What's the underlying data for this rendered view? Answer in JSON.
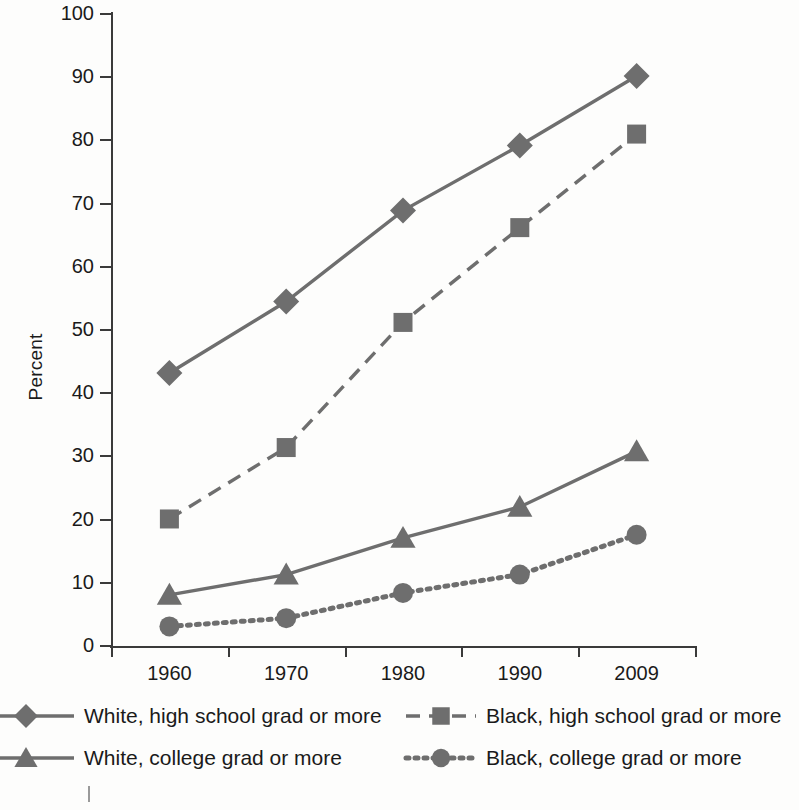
{
  "chart_data": {
    "type": "line",
    "title": "",
    "xlabel": "",
    "ylabel": "Percent",
    "categories": [
      "1960",
      "1970",
      "1980",
      "1990",
      "2009"
    ],
    "ylim": [
      0,
      100
    ],
    "yticks": [
      0,
      10,
      20,
      30,
      40,
      50,
      60,
      70,
      80,
      90,
      100
    ],
    "ytick_labels": [
      "0",
      "10",
      "20",
      "30",
      "40",
      "50",
      "60",
      "70",
      "80",
      "90",
      "100"
    ],
    "grid": false,
    "legend_position": "bottom",
    "series": [
      {
        "name": "White, high school grad or more",
        "marker": "diamond",
        "linestyle": "solid",
        "color": "#6e6e6e",
        "values": [
          43.2,
          54.5,
          68.9,
          79.2,
          90.2
        ]
      },
      {
        "name": "Black, high school grad or more",
        "marker": "square",
        "linestyle": "dashed",
        "color": "#6e6e6e",
        "values": [
          20.1,
          31.4,
          51.2,
          66.2,
          81.0
        ]
      },
      {
        "name": "White, college grad or more",
        "marker": "triangle",
        "linestyle": "solid",
        "color": "#6e6e6e",
        "values": [
          8.1,
          11.3,
          17.1,
          22.0,
          30.8
        ]
      },
      {
        "name": "Black, college grad or more",
        "marker": "circle",
        "linestyle": "dotted",
        "color": "#6e6e6e",
        "values": [
          3.1,
          4.4,
          8.4,
          11.3,
          17.6
        ]
      }
    ]
  },
  "axis": {
    "y_title": "Percent",
    "y_tick_labels": [
      "100",
      "90",
      "80",
      "70",
      "60",
      "50",
      "40",
      "30",
      "20",
      "10",
      "0"
    ],
    "x_tick_labels": [
      "1960",
      "1970",
      "1980",
      "1990",
      "2009"
    ]
  },
  "legend": {
    "entries": [
      {
        "label": "White, high school grad or more",
        "marker": "diamond-marker-icon",
        "linestyle": "solid"
      },
      {
        "label": "Black, high school grad or more",
        "marker": "square-marker-icon",
        "linestyle": "dashed"
      },
      {
        "label": "White, college grad or more",
        "marker": "triangle-marker-icon",
        "linestyle": "solid"
      },
      {
        "label": "Black, college grad or more",
        "marker": "circle-marker-icon",
        "linestyle": "dotted"
      }
    ]
  },
  "caption": {
    "number": "",
    "text": ""
  },
  "colors": {
    "ink": "#1a1a1a",
    "axis": "#3a3a3a",
    "series": "#6e6e6e",
    "background": "#fdfdfc"
  }
}
